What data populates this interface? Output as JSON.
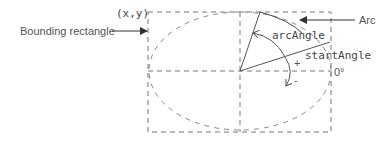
{
  "diagram": {
    "labels": {
      "bounding_rectangle": "Bounding rectangle",
      "origin": "(x,y)",
      "arc": "Arc",
      "arc_angle": "arcAngle",
      "start_angle": "startAngle",
      "zero_degrees": "0°",
      "plus": "+",
      "minus": "-"
    },
    "colors": {
      "line": "#555555",
      "dash": "#777777",
      "text": "#555555"
    }
  }
}
